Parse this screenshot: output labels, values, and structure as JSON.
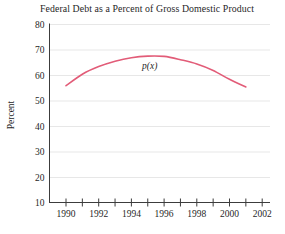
{
  "chart_data": {
    "type": "line",
    "title": "Federal Debt as a Percent of Gross Domestic Product",
    "xlabel": "",
    "ylabel": "Percent",
    "ylim": [
      10,
      80
    ],
    "xlim": [
      1989,
      2002.4
    ],
    "grid": "horizontal-light",
    "legend_position": "inline-curve-label",
    "y_ticks": [
      80,
      70,
      60,
      50,
      40,
      30,
      20,
      10
    ],
    "x_ticks": [
      1990,
      1991,
      1992,
      1993,
      1994,
      1995,
      1996,
      1997,
      1998,
      1999,
      2000,
      2001,
      2002
    ],
    "x_tick_labels": [
      1990,
      1992,
      1994,
      1996,
      1998,
      2000,
      2002
    ],
    "series": [
      {
        "name": "p(x)",
        "x": [
          1990,
          1991,
          1992,
          1993,
          1994,
          1995,
          1996,
          1997,
          1998,
          1999,
          2000,
          2001
        ],
        "values": [
          56,
          60.5,
          63.5,
          65.6,
          67,
          67.6,
          67.5,
          66.2,
          64.5,
          62,
          58.5,
          55.5
        ]
      }
    ],
    "colors": {
      "curve": "#e25c78",
      "grid": "#e7e7e7",
      "axis": "#3c3c3c",
      "text": "#1f1f1f"
    }
  }
}
